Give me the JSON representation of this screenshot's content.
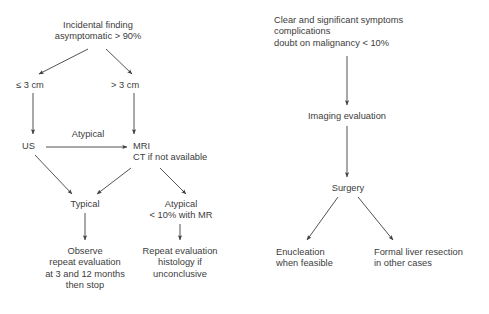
{
  "diagram": {
    "text_color": "#3c3c3c",
    "line_color": "#404040",
    "background": "#ffffff",
    "left_branch": {
      "root": {
        "lines": [
          "Incidental finding",
          "asymptomatic > 90%"
        ]
      },
      "size_small": {
        "lines": [
          "≤ 3 cm"
        ]
      },
      "size_large": {
        "lines": [
          "> 3 cm"
        ]
      },
      "us": {
        "lines": [
          "US"
        ]
      },
      "mri": {
        "lines": [
          "MRI",
          "CT if not available"
        ]
      },
      "atypical_edge_label": {
        "lines": [
          "Atypical"
        ]
      },
      "typical": {
        "lines": [
          "Typical"
        ]
      },
      "atypical_mr": {
        "lines": [
          "Atypical",
          "< 10% with MR"
        ]
      },
      "observe": {
        "lines": [
          "Observe",
          "repeat evaluation",
          "at 3 and 12 months",
          "then stop"
        ]
      },
      "repeat": {
        "lines": [
          "Repeat evaluation",
          "histology if",
          "unconclusive"
        ]
      }
    },
    "right_branch": {
      "root": {
        "lines": [
          "Clear and significant symptoms",
          "complications",
          "doubt on malignancy < 10%"
        ]
      },
      "imaging": {
        "lines": [
          "Imaging evaluation"
        ]
      },
      "surgery": {
        "lines": [
          "Surgery"
        ]
      },
      "enucleation": {
        "lines": [
          "Enucleation",
          "when feasible"
        ]
      },
      "resection": {
        "lines": [
          "Formal liver resection",
          "in other cases"
        ]
      }
    }
  }
}
